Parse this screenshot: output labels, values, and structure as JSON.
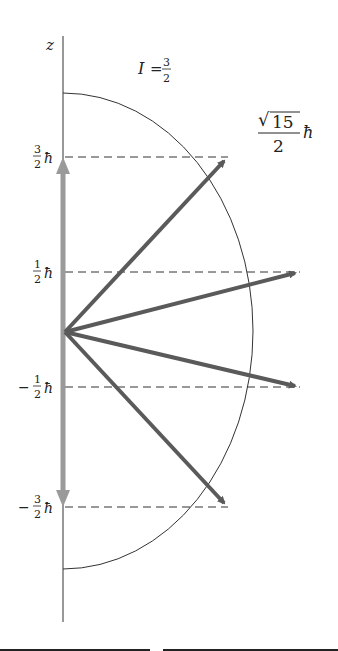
{
  "spin_label": {
    "symbol": "I",
    "eq": "=",
    "num": "3",
    "den": "2"
  },
  "axis_label": "z",
  "magnitude_label": {
    "sqrt": "15",
    "den": "2",
    "unit": "ħ"
  },
  "levels": [
    {
      "sign": "",
      "num": "3",
      "den": "2",
      "unit": "ħ",
      "y": 157,
      "tip_x": 228
    },
    {
      "sign": "",
      "num": "1",
      "den": "2",
      "unit": "ħ",
      "y": 272,
      "tip_x": 300
    },
    {
      "sign": "−",
      "num": "1",
      "den": "2",
      "unit": "ħ",
      "y": 387,
      "tip_x": 300
    },
    {
      "sign": "−",
      "num": "3",
      "den": "2",
      "unit": "ħ",
      "y": 507,
      "tip_x": 228
    }
  ],
  "colors": {
    "arrow": "#5a5a5a",
    "z_arrow": "#9a9a9a",
    "line": "#333333"
  }
}
